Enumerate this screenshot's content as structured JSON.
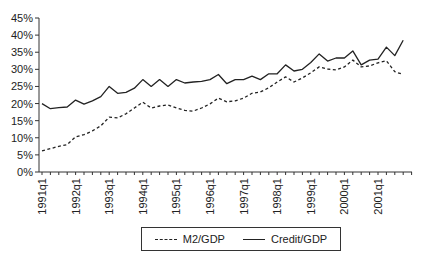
{
  "chart_data": {
    "type": "line",
    "title": "",
    "xlabel": "",
    "ylabel": "",
    "ylim": [
      0,
      45
    ],
    "yticks": [
      "0%",
      "5%",
      "10%",
      "15%",
      "20%",
      "25%",
      "30%",
      "35%",
      "40%",
      "45%"
    ],
    "xtick_labels": [
      "1991q1",
      "1992q1",
      "1993q1",
      "1994q1",
      "1995q1",
      "1996q1",
      "1997q1",
      "1998q1",
      "1999q1",
      "2000q1",
      "2001q1"
    ],
    "grid": false,
    "legend_position": "bottom",
    "x": [
      "1991q1",
      "1991q2",
      "1991q3",
      "1991q4",
      "1992q1",
      "1992q2",
      "1992q3",
      "1992q4",
      "1993q1",
      "1993q2",
      "1993q3",
      "1993q4",
      "1994q1",
      "1994q2",
      "1994q3",
      "1994q4",
      "1995q1",
      "1995q2",
      "1995q3",
      "1995q4",
      "1996q1",
      "1996q2",
      "1996q3",
      "1996q4",
      "1997q1",
      "1997q2",
      "1997q3",
      "1997q4",
      "1998q1",
      "1998q2",
      "1998q3",
      "1998q4",
      "1999q1",
      "1999q2",
      "1999q3",
      "1999q4",
      "2000q1",
      "2000q2",
      "2000q3",
      "2000q4",
      "2001q1",
      "2001q2",
      "2001q3",
      "2001q4"
    ],
    "series": [
      {
        "name": "M2/GDP",
        "style": "dashed",
        "values": [
          6.2,
          6.8,
          7.5,
          8.0,
          10.3,
          10.9,
          12.0,
          13.5,
          16.0,
          15.8,
          17.0,
          18.7,
          20.4,
          18.7,
          19.3,
          19.6,
          18.7,
          18.0,
          17.8,
          18.7,
          19.9,
          21.6,
          20.5,
          20.8,
          21.6,
          23.0,
          23.4,
          24.6,
          26.3,
          27.8,
          26.3,
          27.5,
          29.0,
          30.7,
          30.1,
          29.8,
          30.7,
          32.7,
          30.7,
          31.0,
          31.9,
          32.5,
          29.3,
          28.5
        ]
      },
      {
        "name": "Credit/GDP",
        "style": "solid",
        "values": [
          20.0,
          18.5,
          18.8,
          19.0,
          21.0,
          19.8,
          20.8,
          22.0,
          25.0,
          23.0,
          23.3,
          24.5,
          27.0,
          25.0,
          27.0,
          25.0,
          27.0,
          26.0,
          26.3,
          26.5,
          27.0,
          28.5,
          25.8,
          27.0,
          27.0,
          28.0,
          27.0,
          28.7,
          28.7,
          31.3,
          29.5,
          30.0,
          32.0,
          34.5,
          32.4,
          33.3,
          33.3,
          35.4,
          31.3,
          32.7,
          33.0,
          36.5,
          34.0,
          38.5
        ]
      }
    ]
  },
  "legend": {
    "items": [
      {
        "label": "M2/GDP",
        "style": "dashed"
      },
      {
        "label": "Credit/GDP",
        "style": "solid"
      }
    ]
  }
}
